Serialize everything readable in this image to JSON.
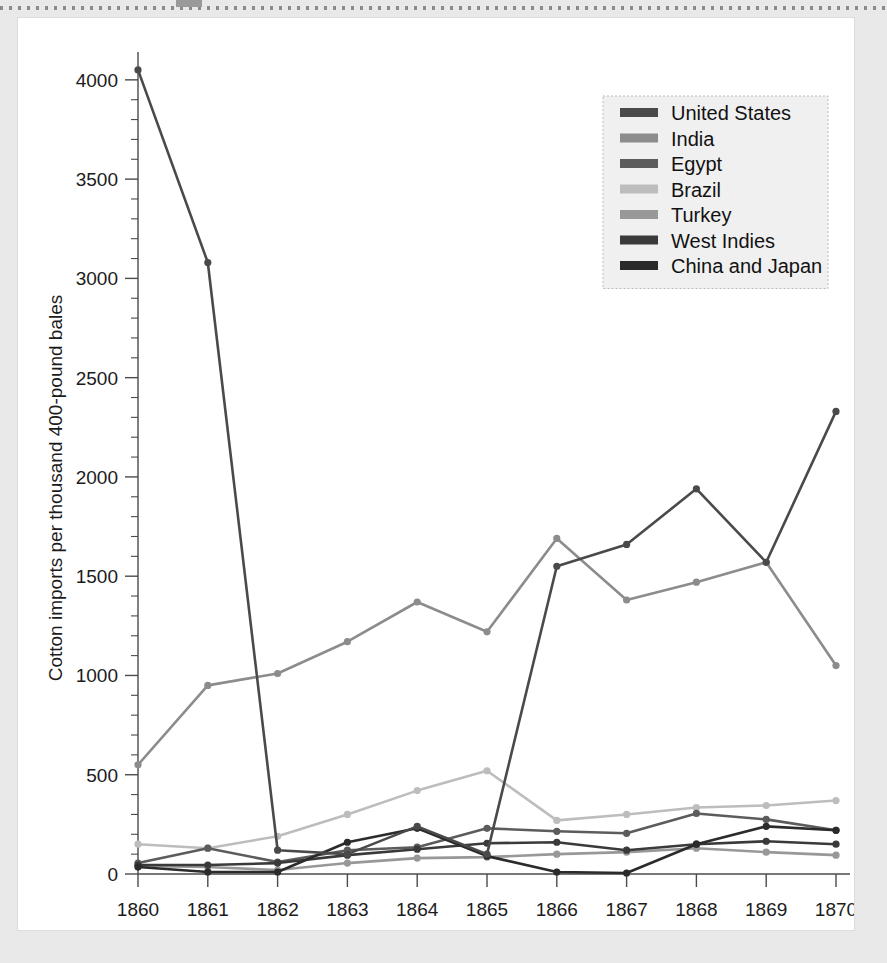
{
  "figure": {
    "background_color": "#e9e9e9",
    "card_color": "#ffffff"
  },
  "chart_data": {
    "type": "line",
    "title": "",
    "subtitle": "",
    "xlabel": "",
    "ylabel": "Cotton imports per thousand 400-pound bales",
    "x": [
      1860,
      1861,
      1862,
      1863,
      1864,
      1865,
      1866,
      1867,
      1868,
      1869,
      1870
    ],
    "categories": [
      "1860",
      "1861",
      "1862",
      "1863",
      "1864",
      "1865",
      "1866",
      "1867",
      "1868",
      "1869",
      "1870"
    ],
    "xlim": [
      1860,
      1870
    ],
    "ylim": [
      0,
      4100
    ],
    "yticks": [
      0,
      500,
      1000,
      1500,
      2000,
      2500,
      3000,
      3500,
      4000
    ],
    "ytick_labels": [
      "0",
      "500",
      "1000",
      "1500",
      "2000",
      "2500",
      "3000",
      "3500",
      "4000"
    ],
    "y_minor_tick_step": 100,
    "grid": false,
    "legend_position": "upper right",
    "series": [
      {
        "name": "United States",
        "color": "#4a4a4a",
        "values": [
          4050,
          3080,
          120,
          100,
          240,
          100,
          1550,
          1660,
          1940,
          1570,
          2330
        ]
      },
      {
        "name": "India",
        "color": "#8c8c8c",
        "values": [
          550,
          950,
          1010,
          1170,
          1370,
          1220,
          1690,
          1380,
          1470,
          1570,
          1050
        ]
      },
      {
        "name": "Egypt",
        "color": "#5c5c5c",
        "values": [
          55,
          130,
          60,
          120,
          135,
          230,
          215,
          205,
          305,
          275,
          220
        ]
      },
      {
        "name": "Brazil",
        "color": "#bdbdbd",
        "values": [
          150,
          130,
          190,
          300,
          420,
          520,
          270,
          300,
          335,
          345,
          370
        ]
      },
      {
        "name": "Turkey",
        "color": "#989898",
        "values": [
          40,
          35,
          20,
          55,
          80,
          85,
          100,
          110,
          130,
          110,
          95
        ]
      },
      {
        "name": "West Indies",
        "color": "#3a3a3a",
        "values": [
          45,
          45,
          55,
          95,
          125,
          155,
          160,
          120,
          150,
          165,
          150
        ]
      },
      {
        "name": "China and Japan",
        "color": "#2b2b2b",
        "values": [
          35,
          10,
          10,
          160,
          230,
          90,
          10,
          5,
          150,
          240,
          220
        ]
      }
    ]
  },
  "legend": {
    "entries": [
      {
        "label": "United States",
        "color": "#4a4a4a"
      },
      {
        "label": "India",
        "color": "#8c8c8c"
      },
      {
        "label": "Egypt",
        "color": "#5c5c5c"
      },
      {
        "label": "Brazil",
        "color": "#bdbdbd"
      },
      {
        "label": "Turkey",
        "color": "#989898"
      },
      {
        "label": "West Indies",
        "color": "#3a3a3a"
      },
      {
        "label": "China and Japan",
        "color": "#2b2b2b"
      }
    ]
  }
}
